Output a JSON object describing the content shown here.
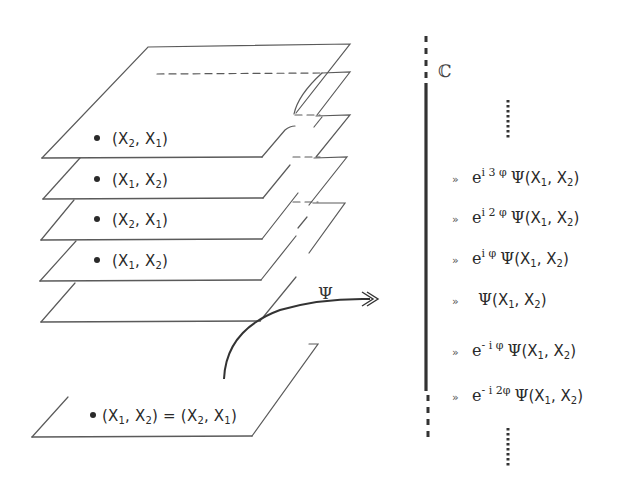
{
  "diagram": {
    "type": "stacked-sheets-to-complex-line",
    "sheets": [
      {
        "label": "(X₂, X₁)",
        "parts": [
          "(X",
          "2",
          ", X",
          "1",
          ")"
        ]
      },
      {
        "label": "(X₁, X₂)",
        "parts": [
          "(X",
          "1",
          ", X",
          "2",
          ")"
        ]
      },
      {
        "label": "(X₂, X₁)",
        "parts": [
          "(X",
          "2",
          ", X",
          "1",
          ")"
        ]
      },
      {
        "label": "(X₁, X₂)",
        "parts": [
          "(X",
          "1",
          ", X",
          "2",
          ")"
        ]
      },
      {
        "label": "",
        "parts": []
      }
    ],
    "base_sheet": {
      "label": "(X₁, X₂) = (X₂, X₁)",
      "parts": [
        "(X",
        "1",
        ", X",
        "2",
        ") = (X",
        "2",
        ", X",
        "1",
        ")"
      ]
    },
    "map_label": "Ψ",
    "complex_axis_label": "ℂ",
    "values": [
      {
        "prefix": "e",
        "exponent": "i 3 φ",
        "func": "Ψ",
        "args": [
          "(X",
          "1",
          ", X",
          "2",
          ")"
        ]
      },
      {
        "prefix": "e",
        "exponent": "i 2 φ",
        "func": "Ψ",
        "args": [
          "(X",
          "1",
          ", X",
          "2",
          ")"
        ]
      },
      {
        "prefix": "e",
        "exponent": "i φ",
        "func": "Ψ",
        "args": [
          "(X",
          "1",
          ", X",
          "2",
          ")"
        ]
      },
      {
        "prefix": "",
        "exponent": "",
        "func": "Ψ",
        "args": [
          "(X",
          "1",
          ", X",
          "2",
          ")"
        ]
      },
      {
        "prefix": "e",
        "exponent": "- i φ",
        "func": "Ψ",
        "args": [
          "(X",
          "1",
          ", X",
          "2",
          ")"
        ]
      },
      {
        "prefix": "e",
        "exponent": "- i 2φ",
        "func": "Ψ",
        "args": [
          "(X",
          "1",
          ", X",
          "2",
          ")"
        ]
      }
    ],
    "bullet_glyph": "»",
    "ellipsis_top": "⋮",
    "ellipsis_bottom": "⋮",
    "colors": {
      "line": "#555555",
      "axis": "#333333",
      "text": "#2a2a2a"
    }
  }
}
